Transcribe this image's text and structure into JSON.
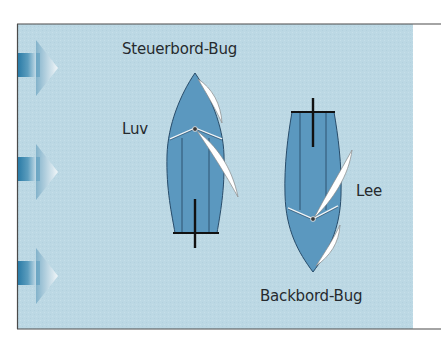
{
  "diagram": {
    "type": "sailing-tack-diagram",
    "colors": {
      "water": "#bcd8e4",
      "hull": "#5b98bf",
      "hull_lines": "#284c6a",
      "sail": "#ffffff",
      "sail_edge": "#8a8a8a",
      "rudder": "#111111",
      "frame": "#4a4a4a",
      "text": "#262a2e",
      "wind_arrow_dark": "#2a7ba6",
      "wind_arrow_light": "#f4f8fa"
    },
    "wind_arrows": [
      {
        "name": "wind-arrow-top",
        "direction": "right"
      },
      {
        "name": "wind-arrow-middle",
        "direction": "right"
      },
      {
        "name": "wind-arrow-bottom",
        "direction": "right"
      }
    ],
    "boats": [
      {
        "name": "boat-starboard-tack",
        "heading": "up",
        "label": "Steuerbord-Bug"
      },
      {
        "name": "boat-port-tack",
        "heading": "down",
        "label": "Backbord-Bug"
      }
    ],
    "labels": {
      "starboard_tack": "Steuerbord-Bug",
      "windward": "Luv",
      "leeward": "Lee",
      "port_tack": "Backbord-Bug"
    }
  }
}
